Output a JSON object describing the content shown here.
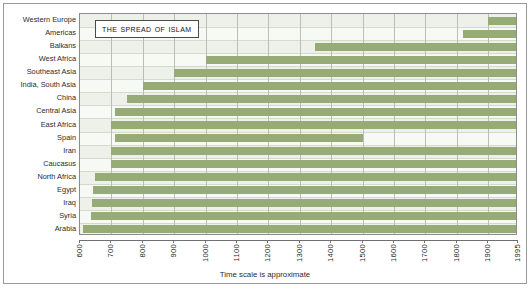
{
  "title": "The Spread of Islam",
  "xcaption": "Time scale is approximate",
  "colors": {
    "bar": "#97ab77",
    "plot_background": "#f4f6f1",
    "row_band": "#eef1e9",
    "grid": "#b9bfb4",
    "frame": "#9a9a9a",
    "text": "#2b2b2b"
  },
  "chart_data": {
    "type": "bar",
    "orientation": "horizontal",
    "title": "The Spread of Islam",
    "xlabel": "Time scale is approximate",
    "ylabel": "",
    "xlim": [
      600,
      1995
    ],
    "grid": true,
    "legend": null,
    "note": "Each bar spans from the approximate year Islam reached the region until the present (1995); Spain's bar ends at the Reconquista.",
    "xticks": [
      600,
      700,
      800,
      900,
      1000,
      1100,
      1200,
      1300,
      1400,
      1500,
      1600,
      1700,
      1800,
      1900,
      1995
    ],
    "xtick_labels": [
      "600",
      "700",
      "800",
      "900",
      "1000",
      "1100",
      "1200",
      "1300",
      "1400",
      "1500",
      "1600",
      "1700",
      "1800",
      "1900",
      "1995"
    ],
    "categories": [
      "Western Europe",
      "Americas",
      "Balkans",
      "West Africa",
      "Southeast Asia",
      "India, South Asia",
      "China",
      "Central Asia",
      "East Africa",
      "Spain",
      "Iran",
      "Caucasus",
      "North Africa",
      "Egypt",
      "Iraq",
      "Syria",
      "Arabia"
    ],
    "bars": [
      {
        "category": "Western Europe",
        "start": 1900,
        "end": 1995
      },
      {
        "category": "Americas",
        "start": 1820,
        "end": 1995
      },
      {
        "category": "Balkans",
        "start": 1350,
        "end": 1995
      },
      {
        "category": "West Africa",
        "start": 1000,
        "end": 1995
      },
      {
        "category": "Southeast Asia",
        "start": 900,
        "end": 1995
      },
      {
        "category": "India, South Asia",
        "start": 800,
        "end": 1995
      },
      {
        "category": "China",
        "start": 750,
        "end": 1995
      },
      {
        "category": "Central Asia",
        "start": 712,
        "end": 1995
      },
      {
        "category": "East Africa",
        "start": 700,
        "end": 1995
      },
      {
        "category": "Spain",
        "start": 711,
        "end": 1500
      },
      {
        "category": "Iran",
        "start": 700,
        "end": 1995
      },
      {
        "category": "Caucasus",
        "start": 700,
        "end": 1995
      },
      {
        "category": "North Africa",
        "start": 647,
        "end": 1995
      },
      {
        "category": "Egypt",
        "start": 640,
        "end": 1995
      },
      {
        "category": "Iraq",
        "start": 637,
        "end": 1995
      },
      {
        "category": "Syria",
        "start": 635,
        "end": 1995
      },
      {
        "category": "Arabia",
        "start": 610,
        "end": 1995
      }
    ]
  }
}
